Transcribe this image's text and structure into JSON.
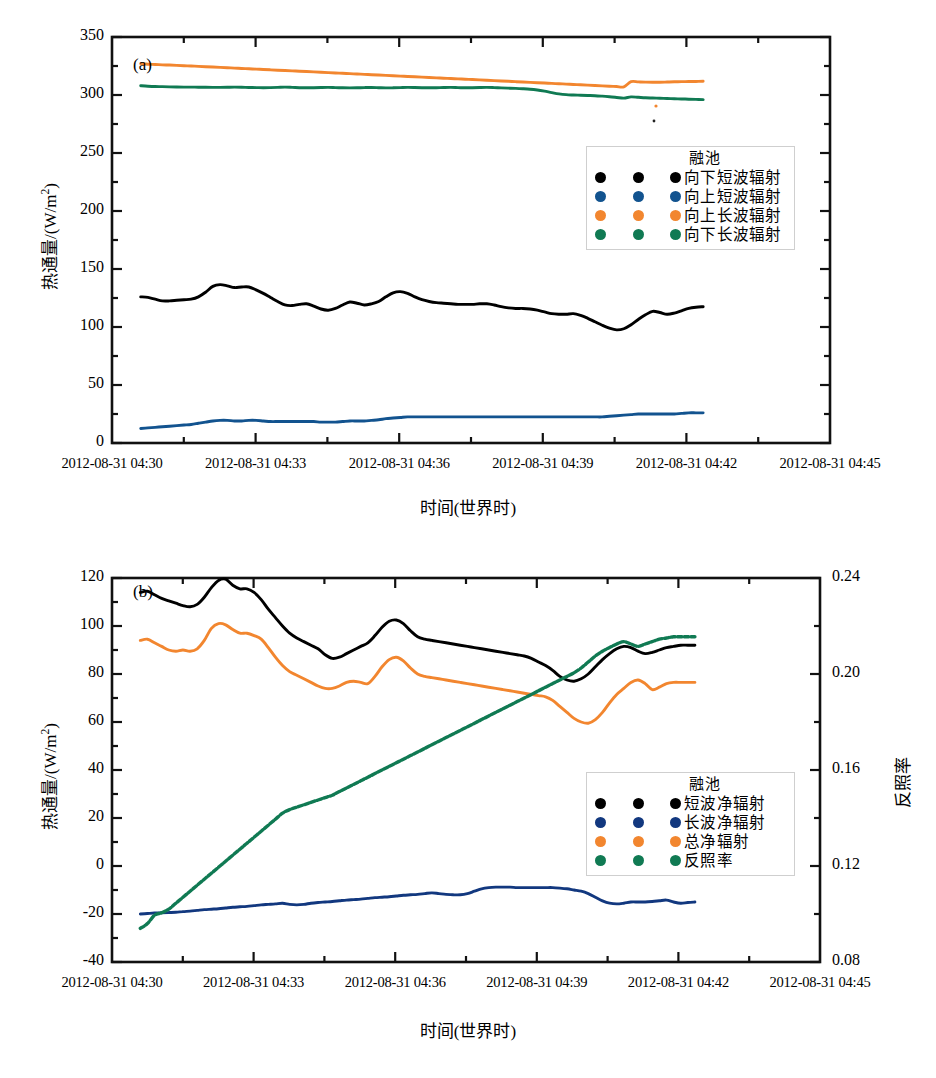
{
  "figure": {
    "panel_a_tag": "(a)",
    "panel_b_tag": "(b)"
  },
  "chart_data": [
    {
      "type": "line",
      "panel": "(a)",
      "title": "",
      "xlabel": "时间(世界时)",
      "ylabel": "热通量/((W/m²)",
      "ylabel_text": "热通量/(W/m2)",
      "ylim": [
        0,
        350
      ],
      "yticks": [
        0,
        50,
        100,
        150,
        200,
        250,
        300,
        350
      ],
      "ytick_labels": [
        "0",
        "50",
        "100",
        "150",
        "200",
        "250",
        "300",
        "350"
      ],
      "yminor_step": 25,
      "xlim": [
        "2012-08-31 04:30",
        "2012-08-31 04:45"
      ],
      "xticks": [
        "2012-08-31 04:30",
        "2012-08-31 04:33",
        "2012-08-31 04:36",
        "2012-08-31 04:39",
        "2012-08-31 04:42",
        "2012-08-31 04:45"
      ],
      "x_minutes": [
        0,
        3,
        6,
        9,
        12,
        15
      ],
      "x_data_range_min": [
        0.6,
        12.35
      ],
      "grid": false,
      "legend_position": "inside-right-upper",
      "legend": {
        "title": "融池",
        "entries": [
          {
            "label": "向下短波辐射",
            "color": "#000000"
          },
          {
            "label": "向上短波辐射",
            "color": "#12538f"
          },
          {
            "label": "向上长波辐射",
            "color": "#f2862f"
          },
          {
            "label": "向下长波辐射",
            "color": "#107a53"
          }
        ]
      },
      "series": [
        {
          "name": "向下短波辐射",
          "color": "#000000",
          "unit": "W/m2",
          "values": [
            126,
            125.5,
            124,
            122.5,
            122.5,
            123,
            123.5,
            124,
            126,
            130,
            135,
            136.5,
            135.5,
            134,
            134.5,
            134.5,
            132,
            129,
            125.5,
            122,
            119,
            118.5,
            119.5,
            120,
            118,
            115.5,
            114.5,
            116,
            119,
            121.5,
            120.5,
            119,
            120,
            122,
            126,
            129.5,
            130.5,
            129,
            126,
            123.5,
            122,
            121,
            120.5,
            120,
            119.5,
            119.5,
            119.5,
            120,
            120,
            119,
            117.5,
            116.5,
            116,
            116,
            115.5,
            114.5,
            113,
            111.5,
            111,
            111,
            111.5,
            110,
            107.5,
            104.5,
            101.5,
            99,
            97.5,
            98.5,
            102,
            106.5,
            110.5,
            113.5,
            112.5,
            111,
            112,
            114,
            116,
            117,
            117.5
          ]
        },
        {
          "name": "向上短波辐射",
          "color": "#12538f",
          "unit": "W/m2",
          "values": [
            12.5,
            13,
            13.5,
            14,
            14.5,
            15,
            15.5,
            16,
            17,
            18,
            19,
            19.5,
            19.5,
            19,
            19,
            19.5,
            19.5,
            19,
            18.5,
            18.5,
            18.5,
            18.5,
            18.5,
            18.5,
            18.5,
            18,
            18,
            18,
            18.5,
            19,
            19,
            19,
            19.5,
            20,
            21,
            21.5,
            22,
            22.5,
            22.5,
            22.5,
            22.5,
            22.5,
            22.5,
            22.5,
            22.5,
            22.5,
            22.5,
            22.5,
            22.5,
            22.5,
            22.5,
            22.5,
            22.5,
            22.5,
            22.5,
            22.5,
            22.5,
            22.5,
            22.5,
            22.5,
            22.5,
            22.5,
            22.5,
            22.5,
            22.5,
            23,
            23.5,
            24,
            24.5,
            25,
            25,
            25,
            25,
            25,
            25,
            25.5,
            26,
            26,
            26
          ]
        },
        {
          "name": "向上长波辐射",
          "color": "#f2862f",
          "unit": "W/m2",
          "values": [
            327,
            326.5,
            326.3,
            326,
            325.8,
            325.5,
            325.2,
            325,
            324.7,
            324.4,
            324.1,
            323.8,
            323.5,
            323.2,
            322.9,
            322.6,
            322.3,
            322,
            321.7,
            321.4,
            321.1,
            320.8,
            320.5,
            320.2,
            319.9,
            319.6,
            319.3,
            319,
            318.7,
            318.4,
            318.1,
            317.8,
            317.5,
            317.2,
            316.9,
            316.6,
            316.3,
            316,
            315.7,
            315.4,
            315.1,
            314.8,
            314.5,
            314.2,
            313.9,
            313.6,
            313.3,
            313,
            312.7,
            312.4,
            312.1,
            311.8,
            311.5,
            311.2,
            310.9,
            310.6,
            310.3,
            310,
            309.7,
            309.4,
            309.1,
            308.8,
            308.5,
            308.2,
            307.9,
            307.6,
            307.3,
            307,
            311.5,
            311.3,
            311.1,
            311,
            311,
            311.2,
            311.4,
            311.5,
            311.6,
            311.7,
            311.8
          ]
        },
        {
          "name": "向下长波辐射",
          "color": "#107a53",
          "unit": "W/m2",
          "values": [
            308,
            307.6,
            307.3,
            307.2,
            307,
            306.9,
            306.8,
            306.8,
            306.7,
            306.7,
            306.6,
            306.6,
            306.7,
            306.8,
            306.7,
            306.5,
            306.4,
            306.3,
            306.4,
            306.6,
            306.8,
            306.6,
            306.3,
            306.2,
            306.3,
            306.5,
            306.6,
            306.4,
            306.2,
            306.1,
            306.2,
            306.4,
            306.5,
            306.3,
            306.1,
            306.2,
            306.4,
            306.6,
            306.5,
            306.3,
            306.2,
            306.3,
            306.5,
            306.6,
            306.4,
            306.2,
            306.3,
            306.5,
            306.6,
            306.4,
            306.1,
            305.9,
            305.7,
            305.4,
            305,
            304.3,
            303.3,
            302.1,
            301,
            300.3,
            300,
            299.8,
            299.6,
            299.4,
            299,
            298.5,
            297.9,
            297.3,
            298.4,
            298.0,
            297.6,
            297.4,
            297.2,
            297.0,
            296.8,
            296.6,
            296.4,
            296.2,
            296.0
          ]
        }
      ]
    },
    {
      "type": "line",
      "panel": "(b)",
      "title": "",
      "xlabel": "时间(世界时)",
      "ylabel": "热通量/(W/m2)",
      "ylabel_right": "反照率",
      "ylim": [
        -40,
        120
      ],
      "yticks": [
        -40,
        -20,
        0,
        20,
        40,
        60,
        80,
        100,
        120
      ],
      "ytick_labels": [
        "-40",
        "-20",
        "0",
        "20",
        "40",
        "60",
        "80",
        "100",
        "120"
      ],
      "yminor_step": 10,
      "ylim_right": [
        0.08,
        0.24
      ],
      "yticks_right": [
        0.08,
        0.12,
        0.16,
        0.2,
        0.24
      ],
      "ytick_labels_right": [
        "0.08",
        "0.12",
        "0.16",
        "0.20",
        "0.24"
      ],
      "yminor_step_right": 0.02,
      "xlim": [
        "2012-08-31 04:30",
        "2012-08-31 04:45"
      ],
      "xticks": [
        "2012-08-31 04:30",
        "2012-08-31 04:33",
        "2012-08-31 04:36",
        "2012-08-31 04:39",
        "2012-08-31 04:42",
        "2012-08-31 04:45"
      ],
      "x_minutes": [
        0,
        3,
        6,
        9,
        12,
        15
      ],
      "x_data_range_min": [
        0.6,
        12.35
      ],
      "grid": false,
      "legend_position": "inside-right-lower",
      "legend": {
        "title": "融池",
        "entries": [
          {
            "label": "短波净辐射",
            "color": "#000000"
          },
          {
            "label": "长波净辐射",
            "color": "#12387f"
          },
          {
            "label": "总净辐射",
            "color": "#f2862f"
          },
          {
            "label": "反照率",
            "color": "#107a53"
          }
        ]
      },
      "series": [
        {
          "name": "短波净辐射",
          "color": "#000000",
          "axis": "left",
          "unit": "W/m2",
          "values": [
            114,
            114.5,
            113,
            111.5,
            110.5,
            109.5,
            108.5,
            108,
            109,
            112,
            116,
            119,
            119.5,
            117,
            115.5,
            115.5,
            114,
            111,
            107,
            103.5,
            100,
            97,
            95,
            93.5,
            92,
            90.5,
            88,
            86.5,
            87,
            88.5,
            90,
            91.5,
            93,
            96,
            99.5,
            102,
            102.5,
            101,
            98,
            95.5,
            94.5,
            94,
            93.5,
            93,
            92.5,
            92,
            91.5,
            91,
            90.5,
            90,
            89.5,
            89,
            88.5,
            88,
            87.5,
            86.5,
            85,
            83.5,
            81.5,
            79,
            77.5,
            77,
            78,
            80,
            83,
            86,
            88.5,
            90.5,
            91.5,
            91,
            89.5,
            88.5,
            89,
            90,
            91,
            91.5,
            92,
            92,
            92
          ]
        },
        {
          "name": "长波净辐射",
          "color": "#12387f",
          "axis": "left",
          "unit": "W/m2",
          "values": [
            -20,
            -19.8,
            -19.6,
            -19.5,
            -19.4,
            -19.3,
            -19,
            -18.8,
            -18.5,
            -18.2,
            -18,
            -17.8,
            -17.5,
            -17.2,
            -17,
            -16.8,
            -16.5,
            -16.2,
            -16,
            -15.8,
            -15.5,
            -16,
            -16.2,
            -16,
            -15.5,
            -15.2,
            -15,
            -14.8,
            -14.5,
            -14.2,
            -14,
            -13.8,
            -13.5,
            -13.2,
            -13,
            -12.8,
            -12.5,
            -12.2,
            -12,
            -11.8,
            -11.5,
            -11.2,
            -11.5,
            -11.8,
            -12,
            -12,
            -11.5,
            -10.5,
            -9.5,
            -9,
            -8.8,
            -8.8,
            -8.8,
            -9,
            -9,
            -9,
            -9,
            -9,
            -9,
            -9.2,
            -9.5,
            -10,
            -10.5,
            -11.5,
            -13,
            -14.5,
            -15.5,
            -15.8,
            -15.5,
            -15,
            -15,
            -15,
            -14.8,
            -14.5,
            -14.2,
            -15,
            -15.5,
            -15.2,
            -15
          ]
        },
        {
          "name": "总净辐射",
          "color": "#f2862f",
          "axis": "left",
          "unit": "W/m2",
          "values": [
            94,
            94.5,
            93,
            91.5,
            90,
            89.5,
            90,
            89.5,
            90.5,
            94,
            99,
            101,
            100.5,
            98.5,
            97,
            97,
            96,
            94.5,
            91,
            87,
            83.5,
            81,
            79.5,
            78,
            76.5,
            75,
            74,
            74,
            75,
            76.5,
            77,
            76.5,
            76,
            79,
            83,
            86,
            87,
            85.5,
            82.5,
            80,
            79,
            78.5,
            78,
            77.5,
            77,
            76.5,
            76,
            75.5,
            75,
            74.5,
            74,
            73.5,
            73,
            72.5,
            72,
            71.5,
            71,
            70.5,
            69,
            66.5,
            64,
            61.5,
            60,
            59.5,
            61,
            64,
            68,
            71.5,
            74,
            76.5,
            77.5,
            76,
            73.5,
            74.5,
            76,
            76.5,
            76.5,
            76.5,
            76.5
          ]
        },
        {
          "name": "反照率",
          "color": "#107a53",
          "axis": "right",
          "unit": "",
          "values": [
            0.094,
            0.096,
            0.0995,
            0.1005,
            0.102,
            0.1045,
            0.107,
            0.1095,
            0.112,
            0.1145,
            0.117,
            0.1195,
            0.122,
            0.1245,
            0.127,
            0.1295,
            0.132,
            0.1345,
            0.137,
            0.1395,
            0.142,
            0.1435,
            0.1445,
            0.1455,
            0.1465,
            0.1475,
            0.1485,
            0.1495,
            0.151,
            0.1525,
            0.154,
            0.1555,
            0.157,
            0.1585,
            0.16,
            0.1615,
            0.163,
            0.1645,
            0.166,
            0.1675,
            0.169,
            0.1705,
            0.172,
            0.1735,
            0.175,
            0.1765,
            0.178,
            0.1795,
            0.181,
            0.1825,
            0.184,
            0.1855,
            0.187,
            0.1885,
            0.19,
            0.1915,
            0.193,
            0.1945,
            0.196,
            0.1975,
            0.199,
            0.2005,
            0.2025,
            0.205,
            0.2075,
            0.2095,
            0.211,
            0.2125,
            0.2135,
            0.2125,
            0.2115,
            0.2125,
            0.2135,
            0.2145,
            0.215,
            0.2155,
            0.2155,
            0.2155,
            0.2155
          ],
          "note": "starts below-left at 0.084 rising to about 0.215"
        }
      ]
    }
  ]
}
